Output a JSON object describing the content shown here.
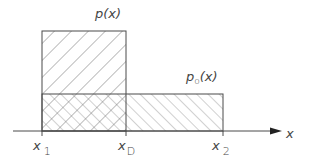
{
  "figure": {
    "type": "probability density comparison diagram",
    "colors": {
      "line": "#4a4a4a",
      "hatch": "#6a6a6a",
      "background": "#ffffff"
    }
  },
  "labels": {
    "p_func": {
      "base": "p(x)"
    },
    "p0_func": {
      "base": "p",
      "sub": "o",
      "rest": "(x)"
    },
    "axis_var": "x",
    "x1": {
      "base": "x",
      "sub": "1"
    },
    "xD": {
      "base": "x",
      "sub": "D"
    },
    "x2": {
      "base": "x",
      "sub": "2"
    }
  },
  "shapes": {
    "p_rect": {
      "x_from": "x1",
      "x_to": "xD",
      "hatch": "backslash"
    },
    "p0_rect": {
      "x_from": "x1",
      "x_to": "x2",
      "hatch": "slash"
    },
    "overlap": {
      "x_from": "x1",
      "x_to": "xD",
      "hatch": "cross"
    }
  }
}
